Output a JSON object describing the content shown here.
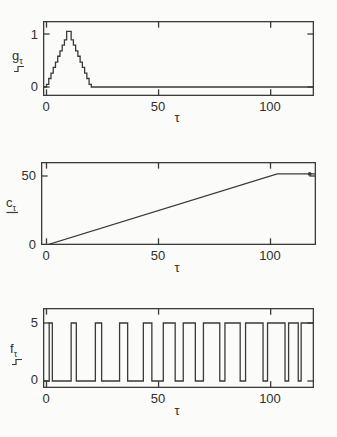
{
  "figure": {
    "background": "#fbfbf9",
    "line_color": "#3a3a3a",
    "text_color": "#2f2f2f"
  },
  "chart_data": [
    {
      "type": "line",
      "id": "g",
      "title": "",
      "xlabel": "τ",
      "ylabel_main": "g",
      "ylabel_sub": "τ",
      "ylabel_marker": "staircase",
      "xlim": [
        -1.5,
        119.5
      ],
      "ylim": [
        -0.17,
        1.25
      ],
      "xticks": [
        0,
        50,
        100
      ],
      "xtick_labels": [
        "0",
        "50",
        "100"
      ],
      "yticks": [
        1,
        0
      ],
      "ytick_labels": [
        "1",
        "0"
      ],
      "grid": false,
      "series": [
        {
          "name": "g_tau",
          "kind": "step",
          "step_width": 1,
          "start_x": 0,
          "values": [
            0.05,
            0.16,
            0.26,
            0.37,
            0.47,
            0.58,
            0.68,
            0.79,
            0.89,
            1.05,
            1.05,
            0.89,
            0.79,
            0.68,
            0.58,
            0.47,
            0.37,
            0.26,
            0.16,
            0.05
          ],
          "after": 0
        }
      ]
    },
    {
      "type": "line",
      "id": "c",
      "title": "",
      "xlabel": "τ",
      "ylabel_main": "c",
      "ylabel_sub": "τ",
      "ylabel_marker": "underline",
      "xlim": [
        -2.5,
        120.5
      ],
      "ylim": [
        0,
        60
      ],
      "xticks": [
        0,
        50,
        100
      ],
      "xtick_labels": [
        "0",
        "50",
        "100"
      ],
      "yticks": [
        50,
        0
      ],
      "ytick_labels": [
        "50",
        "0"
      ],
      "grid": false,
      "series": [
        {
          "name": "c_tau",
          "kind": "polyline",
          "points": [
            [
              -1.5,
              0
            ],
            [
              0,
              0
            ],
            [
              103,
              51.5
            ],
            [
              120.5,
              51.5
            ]
          ]
        }
      ],
      "end_marker": [
        117.5,
        51.5
      ]
    },
    {
      "type": "line",
      "id": "f",
      "title": "",
      "xlabel": "τ",
      "ylabel_main": "f",
      "ylabel_sub": "τ",
      "ylabel_marker": "staircase",
      "xlim": [
        -1.5,
        119.5
      ],
      "ylim": [
        -0.6,
        6.3
      ],
      "xticks": [
        0,
        50,
        100
      ],
      "xtick_labels": [
        "0",
        "50",
        "100"
      ],
      "yticks": [
        5,
        0
      ],
      "ytick_labels": [
        "5",
        "0"
      ],
      "grid": false,
      "series": [
        {
          "name": "f_tau",
          "kind": "pulse",
          "low": 0,
          "high": 5,
          "high_intervals": [
            [
              1.2,
              2.6
            ],
            [
              11,
              13.3
            ],
            [
              21.8,
              24.6
            ],
            [
              32.6,
              36.2
            ],
            [
              43.2,
              47
            ],
            [
              52.1,
              57.4
            ],
            [
              61,
              66.4
            ],
            [
              70,
              77.3
            ],
            [
              79.6,
              86.4
            ],
            [
              88.8,
              96.6
            ],
            [
              98.6,
              106.4
            ],
            [
              108,
              112.3
            ],
            [
              113.6,
              120
            ]
          ]
        }
      ]
    }
  ]
}
